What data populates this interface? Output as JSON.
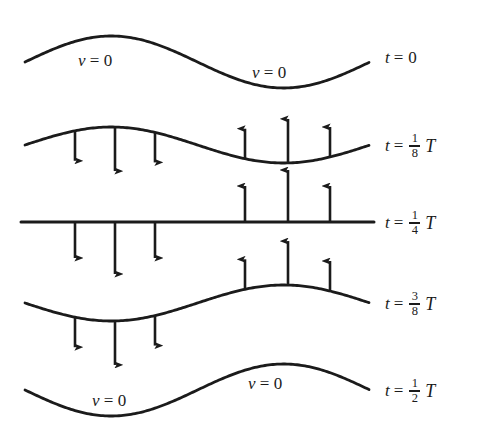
{
  "figure": {
    "stroke_color": "#1b1b1b",
    "background_color": "#ffffff",
    "wave_left_x": 25,
    "wave_right_x": 370,
    "crest_x": 115,
    "trough_x": 288
  },
  "rows": [
    {
      "id": "t0",
      "time_label": {
        "var": "t",
        "eq": "=",
        "value": "0",
        "is_fraction": false,
        "period": ""
      },
      "baseline_y": 62,
      "amplitude": 26,
      "phase": "full-positive",
      "velocity_labels": [
        {
          "text_var": "v",
          "text_eq": "= 0",
          "x": 78,
          "y": 52
        },
        {
          "text_var": "v",
          "text_eq": "= 0",
          "x": 252,
          "y": 64
        }
      ],
      "arrows": []
    },
    {
      "id": "t1over8",
      "time_label": {
        "var": "t",
        "eq": "=",
        "numerator": "1",
        "denominator": "8",
        "is_fraction": true,
        "period": "T"
      },
      "baseline_y": 145,
      "amplitude": 18,
      "phase": "full-positive",
      "velocity_labels": [],
      "arrows": [
        {
          "x": 75,
          "dir": "down",
          "length": 30
        },
        {
          "x": 115,
          "dir": "down",
          "length": 44
        },
        {
          "x": 155,
          "dir": "down",
          "length": 30
        },
        {
          "x": 245,
          "dir": "up",
          "length": 30
        },
        {
          "x": 288,
          "dir": "up",
          "length": 44
        },
        {
          "x": 330,
          "dir": "up",
          "length": 30
        }
      ]
    },
    {
      "id": "t1over4",
      "time_label": {
        "var": "t",
        "eq": "=",
        "numerator": "1",
        "denominator": "4",
        "is_fraction": true,
        "period": "T"
      },
      "baseline_y": 222,
      "amplitude": 0,
      "phase": "flat",
      "velocity_labels": [],
      "arrows": [
        {
          "x": 75,
          "dir": "down",
          "length": 36
        },
        {
          "x": 115,
          "dir": "down",
          "length": 52
        },
        {
          "x": 155,
          "dir": "down",
          "length": 36
        },
        {
          "x": 245,
          "dir": "up",
          "length": 36
        },
        {
          "x": 288,
          "dir": "up",
          "length": 52
        },
        {
          "x": 330,
          "dir": "up",
          "length": 36
        }
      ]
    },
    {
      "id": "t3over8",
      "time_label": {
        "var": "t",
        "eq": "=",
        "numerator": "3",
        "denominator": "8",
        "is_fraction": true,
        "period": "T"
      },
      "baseline_y": 303,
      "amplitude": 18,
      "phase": "full-negative",
      "velocity_labels": [],
      "arrows": [
        {
          "x": 75,
          "dir": "down",
          "length": 30
        },
        {
          "x": 115,
          "dir": "down",
          "length": 44
        },
        {
          "x": 155,
          "dir": "down",
          "length": 30
        },
        {
          "x": 245,
          "dir": "up",
          "length": 30
        },
        {
          "x": 288,
          "dir": "up",
          "length": 44
        },
        {
          "x": 330,
          "dir": "up",
          "length": 30
        }
      ]
    },
    {
      "id": "t1over2",
      "time_label": {
        "var": "t",
        "eq": "=",
        "numerator": "1",
        "denominator": "2",
        "is_fraction": true,
        "period": "T"
      },
      "baseline_y": 390,
      "amplitude": 26,
      "phase": "full-negative",
      "velocity_labels": [
        {
          "text_var": "v",
          "text_eq": "= 0",
          "x": 92,
          "y": 392
        },
        {
          "text_var": "v",
          "text_eq": "= 0",
          "x": 248,
          "y": 375
        }
      ],
      "arrows": []
    }
  ],
  "time_labels_x": 385
}
